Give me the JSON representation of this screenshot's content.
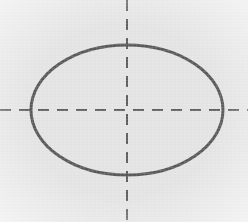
{
  "figure": {
    "background_color": "#e3e3e3",
    "stroke_color": "#595959",
    "axis_color": "#5e5e5e",
    "canvas": {
      "width": 248,
      "height": 222
    }
  },
  "chart_data": {
    "type": "scatter",
    "subtitle": "",
    "xlabel": "",
    "ylabel": "",
    "grid": false,
    "legend_position": "none",
    "xlim": [
      0,
      248
    ],
    "ylim": [
      0,
      222
    ],
    "tick_labels": {
      "x": [],
      "y": []
    },
    "annotations": [],
    "shapes": [
      {
        "name": "ellipse-outline",
        "type": "ellipse",
        "center_x": 127,
        "center_y": 110,
        "radius_x": 96,
        "radius_y": 65,
        "stroke": "#595959",
        "stroke_width": 3,
        "fill": "none",
        "dashed": false
      },
      {
        "name": "major-axis-horizontal",
        "type": "line",
        "x1": 0,
        "y1": 110,
        "x2": 248,
        "y2": 110,
        "stroke": "#5e5e5e",
        "stroke_width": 2,
        "dashed": true,
        "dash_pattern": "11 8"
      },
      {
        "name": "minor-axis-vertical",
        "type": "line",
        "x1": 127,
        "y1": 0,
        "x2": 127,
        "y2": 222,
        "stroke": "#5e5e5e",
        "stroke_width": 2,
        "dashed": true,
        "dash_pattern": "11 8"
      }
    ],
    "series": [
      {
        "name": "ellipse-boundary",
        "values": [],
        "description": "Closed ellipse curve centered at (127, 110) with semi-axes 96 and 65 pixels"
      }
    ]
  }
}
